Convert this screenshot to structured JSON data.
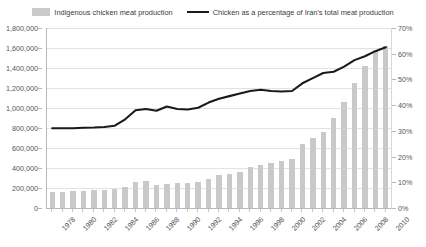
{
  "legend": {
    "bar_series_label": "Indigenous chicken meat production",
    "line_series_label": "Chicken as a percentage of Iran's total meat production",
    "bar_swatch_color": "#c9c9c9",
    "line_swatch_color": "#1a1a1a"
  },
  "axes": {
    "left_ticks": [
      "1,800,000",
      "1,600,000",
      "1,400,000",
      "1,200,000",
      "1,000,000",
      "800,000",
      "600,000",
      "400,000",
      "200,000",
      "0"
    ],
    "right_ticks": [
      "70%",
      "60%",
      "50%",
      "40%",
      "30%",
      "20%",
      "10%",
      "0%"
    ],
    "x_tick_labels": [
      "1978",
      "1980",
      "1982",
      "1984",
      "1986",
      "1988",
      "1990",
      "1992",
      "1994",
      "1996",
      "1998",
      "2000",
      "2002",
      "2004",
      "2006",
      "2008",
      "2010"
    ]
  },
  "chart_data": {
    "type": "bar",
    "title": "",
    "subtitle": "",
    "xlabel": "",
    "ylabel": "",
    "y2label": "",
    "grid": true,
    "legend_position": "top",
    "ylim": [
      0,
      1800000
    ],
    "y2lim": [
      0,
      70
    ],
    "categories": [
      "1978",
      "1979",
      "1980",
      "1981",
      "1982",
      "1983",
      "1984",
      "1985",
      "1986",
      "1987",
      "1988",
      "1989",
      "1990",
      "1991",
      "1992",
      "1993",
      "1994",
      "1995",
      "1996",
      "1997",
      "1998",
      "1999",
      "2000",
      "2001",
      "2002",
      "2003",
      "2004",
      "2005",
      "2006",
      "2007",
      "2008",
      "2009",
      "2010"
    ],
    "series": [
      {
        "name": "Indigenous chicken meat production",
        "type": "bar",
        "axis": "left",
        "unit": "tonnes",
        "color": "#c9c9c9",
        "values": [
          160000,
          165000,
          170000,
          175000,
          180000,
          185000,
          195000,
          210000,
          265000,
          275000,
          230000,
          240000,
          250000,
          255000,
          260000,
          290000,
          330000,
          345000,
          360000,
          410000,
          430000,
          455000,
          475000,
          490000,
          640000,
          700000,
          760000,
          900000,
          1060000,
          1250000,
          1420000,
          1580000,
          1620000
        ]
      },
      {
        "name": "Chicken as a percentage of Iran's total meat production",
        "type": "line",
        "axis": "right",
        "unit": "%",
        "color": "#1a1a1a",
        "values": [
          31.0,
          31.0,
          31.0,
          31.2,
          31.3,
          31.5,
          32.0,
          34.5,
          38.0,
          38.5,
          37.8,
          39.5,
          38.5,
          38.3,
          39.0,
          41.0,
          42.5,
          43.5,
          44.5,
          45.5,
          46.0,
          45.5,
          45.3,
          45.5,
          48.5,
          50.5,
          52.5,
          53.0,
          55.0,
          57.5,
          59.0,
          61.0,
          62.5
        ]
      }
    ]
  }
}
